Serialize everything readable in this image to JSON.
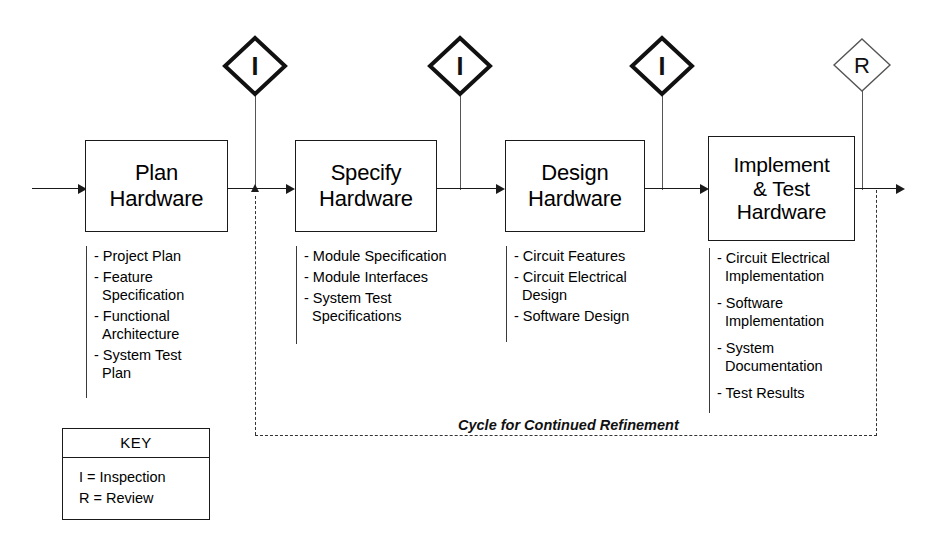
{
  "diagram": {
    "cycle_label": "Cycle for Continued Refinement",
    "phases": [
      {
        "id": "plan",
        "title": "Plan\nHardware",
        "deliverables": [
          "- Project Plan",
          "- Feature\n  Specification",
          "- Functional\n  Architecture",
          "- System Test\n  Plan"
        ]
      },
      {
        "id": "specify",
        "title": "Specify\nHardware",
        "deliverables": [
          "- Module Specification",
          "- Module Interfaces",
          "- System Test\n  Specifications"
        ]
      },
      {
        "id": "design",
        "title": "Design\nHardware",
        "deliverables": [
          "- Circuit Features",
          "- Circuit Electrical\n  Design",
          "- Software Design"
        ]
      },
      {
        "id": "implement",
        "title": "Implement\n& Test\nHardware",
        "deliverables": [
          "- Circuit Electrical\n  Implementation",
          "- Software\n  Implementation",
          "- System\n  Documentation",
          "- Test Results"
        ]
      }
    ],
    "markers": [
      {
        "id": "inspection-1",
        "symbol": "I",
        "kind": "inspection"
      },
      {
        "id": "inspection-2",
        "symbol": "I",
        "kind": "inspection"
      },
      {
        "id": "inspection-3",
        "symbol": "I",
        "kind": "inspection"
      },
      {
        "id": "review-1",
        "symbol": "R",
        "kind": "review"
      }
    ],
    "key": {
      "title": "KEY",
      "lines": [
        "I = Inspection",
        "R = Review"
      ]
    },
    "colors": {
      "stroke": "#1a1a1a",
      "thin_stroke": "#555555",
      "background": "#ffffff"
    }
  }
}
